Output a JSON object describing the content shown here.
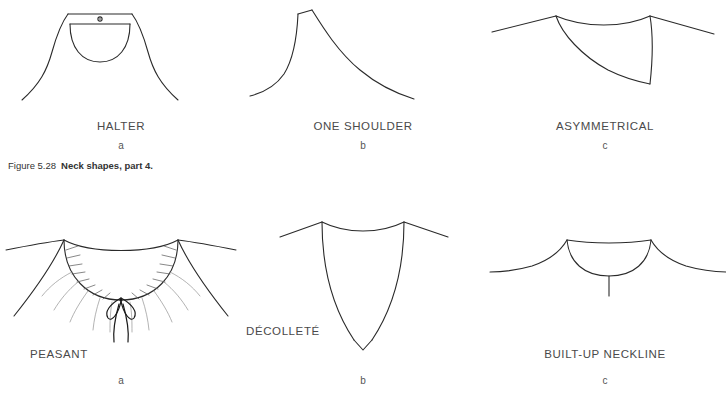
{
  "figure": {
    "caption_number": "Figure 5.28",
    "caption_title": "Neck shapes, part 4.",
    "background_color": "#ffffff",
    "line_color": "#2a2a2a",
    "text_color": "#4a4a4a"
  },
  "panels": [
    {
      "id": "halter",
      "label": "HALTER",
      "sublabel": "a",
      "row": "top",
      "column": 0,
      "description": "Halter neckline with neck band strap, center button and U-shaped front"
    },
    {
      "id": "one-shoulder",
      "label": "ONE SHOULDER",
      "sublabel": "b",
      "row": "top",
      "column": 1,
      "description": "Asymmetric single shoulder bodice with diagonal sweep to opposite side"
    },
    {
      "id": "asymmetrical",
      "label": "ASYMMETRICAL",
      "sublabel": "c",
      "row": "top",
      "column": 2,
      "description": "Asymmetrical neckline with diagonal slash from left shoulder to lower right"
    },
    {
      "id": "peasant",
      "label": "PEASANT",
      "sublabel": "a",
      "row": "bottom",
      "column": 0,
      "description": "Scoop peasant neckline with gathered shirring and center drawstring bow"
    },
    {
      "id": "decollete",
      "label": "DÉCOLLETÉ",
      "sublabel": "b",
      "row": "bottom",
      "column": 1,
      "description": "Deep V décolleté neckline with curved sides meeting at a low point"
    },
    {
      "id": "built-up-neckline",
      "label": "BUILT-UP NECKLINE",
      "sublabel": "c",
      "row": "bottom",
      "column": 2,
      "description": "Built-up collar band with shallow curved neckline and center front placket"
    }
  ],
  "footer": {
    "ghost_text": ""
  }
}
